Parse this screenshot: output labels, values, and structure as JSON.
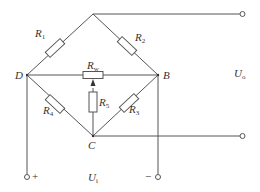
{
  "diagram": {
    "type": "wheatstone-bridge-circuit",
    "stroke_color": "#555555",
    "nodes": [
      {
        "id": "top",
        "label": "",
        "x": 93,
        "y": 14
      },
      {
        "id": "D",
        "label": "D",
        "x": 27,
        "y": 75
      },
      {
        "id": "B",
        "label": "B",
        "x": 158,
        "y": 75
      },
      {
        "id": "C",
        "label": "C",
        "x": 93,
        "y": 136
      }
    ],
    "resistors": [
      {
        "id": "R1",
        "base": "R",
        "sub": "1",
        "between": [
          "D",
          "top"
        ]
      },
      {
        "id": "R2",
        "base": "R",
        "sub": "2",
        "between": [
          "top",
          "B"
        ]
      },
      {
        "id": "R3",
        "base": "R",
        "sub": "3",
        "between": [
          "B",
          "C"
        ]
      },
      {
        "id": "R4",
        "base": "R",
        "sub": "4",
        "between": [
          "D",
          "C"
        ]
      },
      {
        "id": "R5",
        "base": "R",
        "sub": "5",
        "between": [
          "Rw-wiper",
          "C"
        ]
      },
      {
        "id": "Rw",
        "base": "R",
        "sub": "w",
        "between": [
          "D",
          "B"
        ],
        "kind": "potentiometer"
      }
    ],
    "terminals": {
      "output_label": {
        "base": "U",
        "sub": "o"
      },
      "input_label": {
        "base": "U",
        "sub": "i"
      },
      "plus": "+",
      "minus": "−"
    },
    "node_labels": {
      "D": "D",
      "B": "B",
      "C": "C"
    }
  }
}
